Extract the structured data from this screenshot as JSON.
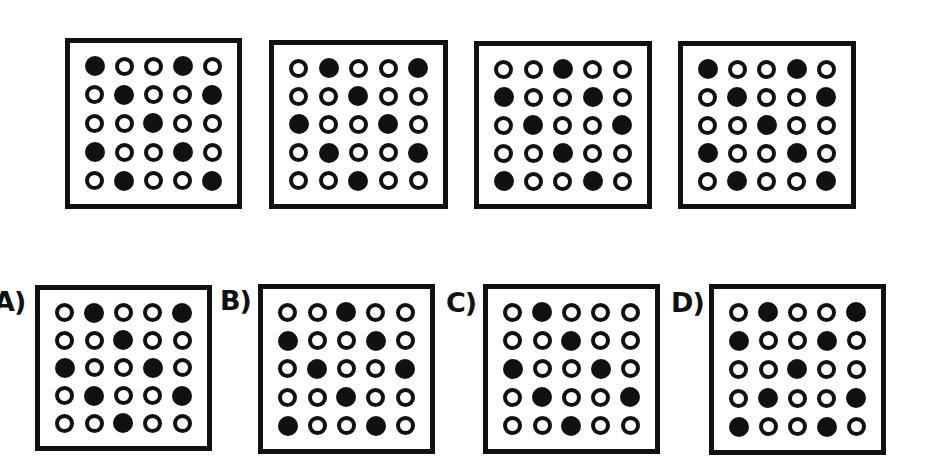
{
  "colors": {
    "ink": "#111111",
    "background": "#ffffff"
  },
  "legend": {
    "filled": "F",
    "empty": "O"
  },
  "sequence": [
    {
      "id": "seq-1",
      "rows": [
        "FOOFO",
        "OFOOF",
        "OOFOO",
        "FOOFO",
        "OFOOF"
      ]
    },
    {
      "id": "seq-2",
      "rows": [
        "OFOOF",
        "OOFOO",
        "FOOFO",
        "OFOOF",
        "OOFOO"
      ]
    },
    {
      "id": "seq-3",
      "rows": [
        "OOFOO",
        "FOOFO",
        "OFOOF",
        "OOFOO",
        "FOOFO"
      ]
    },
    {
      "id": "seq-4",
      "rows": [
        "FOOFO",
        "OFOOF",
        "OOFOO",
        "FOOFO",
        "OFOOF"
      ]
    }
  ],
  "options": [
    {
      "label": "A)",
      "rows": [
        "OFOOF",
        "OOFOO",
        "FOOFO",
        "OFOOF",
        "OOFOO"
      ]
    },
    {
      "label": "B)",
      "rows": [
        "OOFOO",
        "FOOFO",
        "OFOOF",
        "OOFOO",
        "FOOFO"
      ]
    },
    {
      "label": "C)",
      "rows": [
        "OFOOO",
        "OOFOO",
        "FOOFO",
        "OFOOF",
        "OOFOO"
      ]
    },
    {
      "label": "D)",
      "rows": [
        "OFOOF",
        "FOOFO",
        "OOFOO",
        "OFOOF",
        "FOOFO"
      ]
    }
  ]
}
